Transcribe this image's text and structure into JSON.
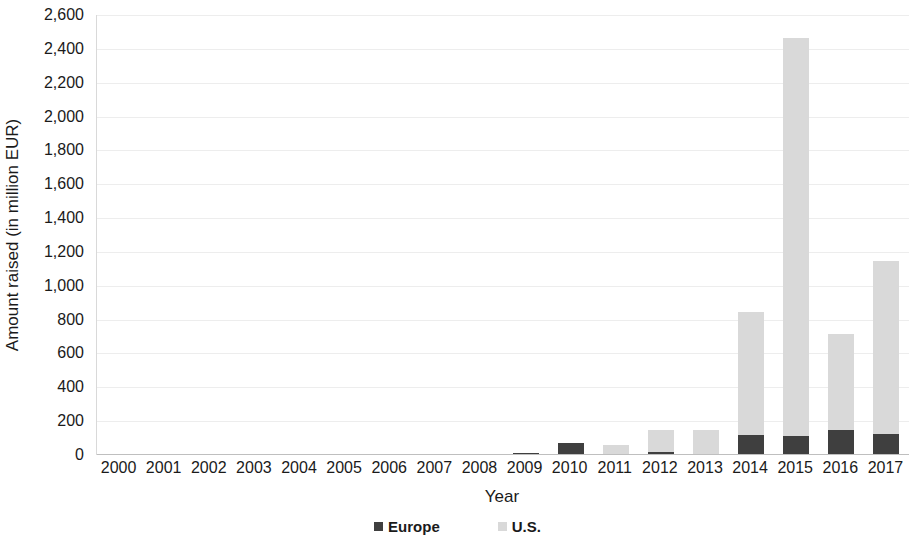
{
  "chart_data": {
    "type": "bar",
    "stacked": true,
    "title": "",
    "xlabel": "Year",
    "ylabel": "Amount raised (in million EUR)",
    "categories": [
      "2000",
      "2001",
      "2002",
      "2003",
      "2004",
      "2005",
      "2006",
      "2007",
      "2008",
      "2009",
      "2010",
      "2011",
      "2012",
      "2013",
      "2014",
      "2015",
      "2016",
      "2017"
    ],
    "series": [
      {
        "name": "Europe",
        "color": "#3f3f3f",
        "values": [
          0,
          0,
          0,
          0,
          0,
          0,
          0,
          0,
          0,
          10,
          70,
          0,
          20,
          0,
          120,
          110,
          145,
          125
        ]
      },
      {
        "name": "U.S.",
        "color": "#d9d9d9",
        "values": [
          0,
          0,
          0,
          0,
          0,
          0,
          0,
          8,
          0,
          0,
          0,
          60,
          130,
          145,
          725,
          2355,
          570,
          1020
        ]
      }
    ],
    "totals": [
      0,
      0,
      0,
      0,
      0,
      0,
      0,
      8,
      0,
      10,
      70,
      60,
      150,
      145,
      845,
      2465,
      715,
      1145
    ],
    "ylim": [
      0,
      2600
    ],
    "yticks": [
      0,
      200,
      400,
      600,
      800,
      1000,
      1200,
      1400,
      1600,
      1800,
      2000,
      2200,
      2400,
      2600
    ],
    "ytick_labels": [
      "0",
      "200",
      "400",
      "600",
      "800",
      "1,000",
      "1,200",
      "1,400",
      "1,600",
      "1,800",
      "2,000",
      "2,200",
      "2,400",
      "2,600"
    ],
    "grid": true,
    "legend_position": "bottom",
    "legend": [
      "Europe",
      "U.S."
    ]
  }
}
